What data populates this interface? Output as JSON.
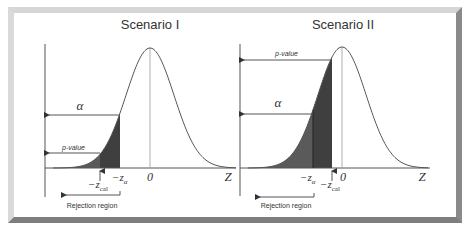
{
  "panels": [
    {
      "id": "scenario-1",
      "title": "Scenario I",
      "center_x": 150,
      "peak_y": 48,
      "baseline_y": 168,
      "sigma": 24,
      "axis_x": 45,
      "axis_top": 44,
      "axis_bottom": 197,
      "baseline_end": 236,
      "z_alpha_x": 120,
      "z_cal_x": 100,
      "labels": {
        "alpha": "α",
        "p_value": "p-value",
        "neg_z_alpha": "−z",
        "alpha_sub": "α",
        "neg_z_cal": "−z",
        "cal_sub": "cal",
        "zero": "0",
        "z_axis": "Z",
        "rejection": "Rejection region"
      },
      "alpha_arrow_y": 115,
      "pvalue_arrow_y": 153,
      "rejection_arrow": {
        "y": 195,
        "x_start": 120,
        "x_end": 62
      }
    },
    {
      "id": "scenario-2",
      "title": "Scenario II",
      "center_x": 342,
      "peak_y": 47,
      "baseline_y": 168,
      "sigma": 24,
      "axis_x": 240,
      "axis_top": 44,
      "axis_bottom": 196,
      "baseline_end": 430,
      "z_alpha_x": 313,
      "z_cal_x": 332,
      "labels": {
        "alpha": "α",
        "p_value": "p-value",
        "neg_z_alpha": "−z",
        "alpha_sub": "α",
        "neg_z_cal": "−z",
        "cal_sub": "cal",
        "zero": "0",
        "z_axis": "Z",
        "rejection": "Rejection region"
      },
      "alpha_arrow_y": 114,
      "pvalue_arrow_y": 60,
      "rejection_arrow": {
        "y": 197,
        "x_start": 314,
        "x_end": 256
      }
    }
  ],
  "colors": {
    "frame_light": "#d6d6d6",
    "frame_dark": "#7e7e7e",
    "shade_dark": "#3f3f3f",
    "shade_mid": "#5a5a5a",
    "line": "#444444"
  }
}
